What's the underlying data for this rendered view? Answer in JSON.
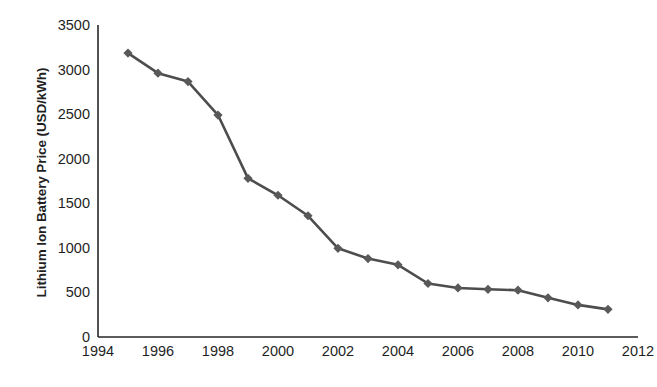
{
  "chart_data": {
    "type": "line",
    "title": "",
    "xlabel": "",
    "ylabel": "Lithium Ion Battery Price (USD/kWh)",
    "x": [
      1995,
      1996,
      1997,
      1998,
      1999,
      2000,
      2001,
      2002,
      2003,
      2004,
      2005,
      2006,
      2007,
      2008,
      2009,
      2010,
      2011
    ],
    "values": [
      3185,
      2960,
      2865,
      2490,
      1780,
      1590,
      1360,
      995,
      880,
      810,
      600,
      550,
      535,
      525,
      440,
      360,
      310
    ],
    "series": [
      {
        "name": "Lithium Ion Battery Price",
        "values": [
          3185,
          2960,
          2865,
          2490,
          1780,
          1590,
          1360,
          995,
          880,
          810,
          600,
          550,
          535,
          525,
          440,
          360,
          310
        ]
      }
    ],
    "xlim": [
      1994,
      2012
    ],
    "ylim": [
      0,
      3500
    ],
    "ytick_labels": [
      "0",
      "500",
      "1000",
      "1500",
      "2000",
      "2500",
      "3000",
      "3500"
    ],
    "ytick_values": [
      0,
      500,
      1000,
      1500,
      2000,
      2500,
      3000,
      3500
    ],
    "xtick_labels": [
      "1994",
      "1996",
      "1998",
      "2000",
      "2002",
      "2004",
      "2006",
      "2008",
      "2010",
      "2012"
    ],
    "xtick_values": [
      1994,
      1996,
      1998,
      2000,
      2002,
      2004,
      2006,
      2008,
      2010,
      2012
    ],
    "grid": false,
    "legend": "none",
    "line_color": "#4d4d4d",
    "marker_color": "#595959",
    "marker_shape": "diamond",
    "axis_color": "#262626",
    "background": "#ffffff"
  }
}
